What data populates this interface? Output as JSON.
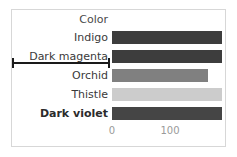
{
  "figure": {
    "background": "#ffffff",
    "frame_color": "#d7d7d7"
  },
  "header": {
    "column_label": "Color"
  },
  "axis": {
    "ticks": [
      {
        "label": "0",
        "value": 0,
        "x": 112
      },
      {
        "label": "100",
        "value": 100,
        "x": 170
      }
    ]
  },
  "annotation": {
    "type": "range-bracket",
    "row": "Dark magenta",
    "color": "#1a1a1a",
    "x_start": 12,
    "x_end": 110
  },
  "rows": [
    {
      "label": "Indigo",
      "bold": false,
      "value": 190,
      "bar_width": 110,
      "color": "#3d3d3d",
      "top": 28
    },
    {
      "label": "Dark magenta",
      "bold": false,
      "value": 190,
      "bar_width": 110,
      "color": "#3d3d3d",
      "top": 47
    },
    {
      "label": "Orchid",
      "bold": false,
      "value": 165,
      "bar_width": 96,
      "color": "#808080",
      "top": 66
    },
    {
      "label": "Thistle",
      "bold": false,
      "value": 190,
      "bar_width": 110,
      "color": "#cccccc",
      "top": 85
    },
    {
      "label": "Dark violet",
      "bold": true,
      "value": 190,
      "bar_width": 110,
      "color": "#454545",
      "top": 104
    }
  ],
  "chart_data": {
    "type": "bar",
    "orientation": "horizontal",
    "title": "",
    "xlabel": "",
    "ylabel": "Color",
    "categories": [
      "Indigo",
      "Dark magenta",
      "Orchid",
      "Thistle",
      "Dark violet"
    ],
    "values": [
      190,
      190,
      165,
      190,
      190
    ],
    "colors": [
      "#3d3d3d",
      "#3d3d3d",
      "#808080",
      "#cccccc",
      "#454545"
    ],
    "xlim": [
      0,
      200
    ],
    "xticks": [
      0,
      100
    ],
    "xticklabels": [
      "0",
      "100"
    ],
    "grid": false,
    "legend": "none",
    "annotations": [
      {
        "kind": "range-bracket",
        "attached_to": "Dark magenta",
        "description": "horizontal line with end caps drawn across the label area"
      }
    ]
  }
}
